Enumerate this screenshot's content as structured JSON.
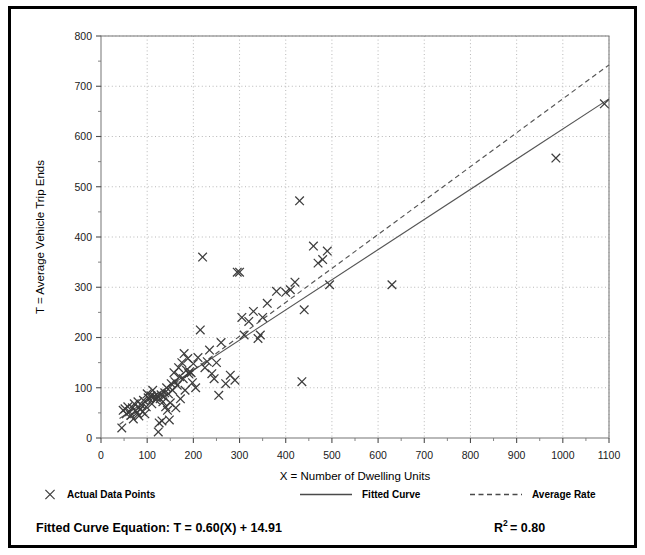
{
  "chart_data": {
    "type": "scatter",
    "title": "",
    "xlabel": "X = Number of Dwelling Units",
    "ylabel": "T = Average Vehicle Trip Ends",
    "xlim": [
      0,
      1100
    ],
    "ylim": [
      0,
      800
    ],
    "xticks": [
      0,
      100,
      200,
      300,
      400,
      500,
      600,
      700,
      800,
      900,
      1000,
      1100
    ],
    "yticks": [
      0,
      100,
      200,
      300,
      400,
      500,
      600,
      700,
      800
    ],
    "x_minor_step": 50,
    "y_minor_step": 50,
    "grid": "dotted-major-both",
    "legend_position": "below-axes",
    "series": [
      {
        "name": "Actual Data Points",
        "type": "scatter",
        "marker": "x",
        "color": "#3c3c3c",
        "points": [
          [
            45,
            20
          ],
          [
            48,
            55
          ],
          [
            52,
            58
          ],
          [
            55,
            48
          ],
          [
            58,
            62
          ],
          [
            62,
            52
          ],
          [
            65,
            45
          ],
          [
            68,
            60
          ],
          [
            70,
            38
          ],
          [
            72,
            68
          ],
          [
            75,
            55
          ],
          [
            78,
            50
          ],
          [
            80,
            72
          ],
          [
            82,
            44
          ],
          [
            85,
            58
          ],
          [
            88,
            65
          ],
          [
            90,
            52
          ],
          [
            92,
            75
          ],
          [
            95,
            48
          ],
          [
            98,
            62
          ],
          [
            100,
            88
          ],
          [
            102,
            80
          ],
          [
            105,
            78
          ],
          [
            108,
            84
          ],
          [
            110,
            68
          ],
          [
            112,
            95
          ],
          [
            115,
            82
          ],
          [
            118,
            76
          ],
          [
            120,
            80
          ],
          [
            122,
            84
          ],
          [
            124,
            12
          ],
          [
            126,
            30
          ],
          [
            128,
            78
          ],
          [
            130,
            86
          ],
          [
            132,
            34
          ],
          [
            134,
            72
          ],
          [
            136,
            82
          ],
          [
            138,
            90
          ],
          [
            140,
            62
          ],
          [
            142,
            100
          ],
          [
            144,
            55
          ],
          [
            146,
            88
          ],
          [
            148,
            36
          ],
          [
            150,
            70
          ],
          [
            152,
            108
          ],
          [
            155,
            95
          ],
          [
            158,
            130
          ],
          [
            160,
            112
          ],
          [
            162,
            60
          ],
          [
            165,
            105
          ],
          [
            168,
            140
          ],
          [
            170,
            122
          ],
          [
            172,
            78
          ],
          [
            175,
            150
          ],
          [
            178,
            118
          ],
          [
            180,
            168
          ],
          [
            182,
            95
          ],
          [
            185,
            135
          ],
          [
            188,
            158
          ],
          [
            190,
            128
          ],
          [
            192,
            132
          ],
          [
            195,
            130
          ],
          [
            198,
            110
          ],
          [
            200,
            148
          ],
          [
            205,
            100
          ],
          [
            210,
            160
          ],
          [
            215,
            215
          ],
          [
            220,
            360
          ],
          [
            225,
            140
          ],
          [
            230,
            152
          ],
          [
            235,
            175
          ],
          [
            240,
            128
          ],
          [
            245,
            118
          ],
          [
            250,
            150
          ],
          [
            255,
            85
          ],
          [
            260,
            190
          ],
          [
            270,
            108
          ],
          [
            280,
            125
          ],
          [
            290,
            115
          ],
          [
            295,
            330
          ],
          [
            300,
            330
          ],
          [
            305,
            240
          ],
          [
            310,
            205
          ],
          [
            320,
            232
          ],
          [
            330,
            252
          ],
          [
            340,
            198
          ],
          [
            345,
            205
          ],
          [
            350,
            240
          ],
          [
            360,
            268
          ],
          [
            380,
            292
          ],
          [
            400,
            290
          ],
          [
            410,
            295
          ],
          [
            420,
            310
          ],
          [
            430,
            472
          ],
          [
            435,
            112
          ],
          [
            440,
            255
          ],
          [
            460,
            382
          ],
          [
            470,
            348
          ],
          [
            480,
            355
          ],
          [
            490,
            372
          ],
          [
            495,
            305
          ],
          [
            630,
            305
          ],
          [
            985,
            557
          ],
          [
            1090,
            665
          ]
        ]
      }
    ],
    "lines": [
      {
        "name": "Fitted Curve",
        "style": "solid",
        "color": "#555555",
        "equation": "T = 0.60(X) + 14.91",
        "slope": 0.6,
        "intercept": 14.91,
        "x_from": 40,
        "x_to": 1100
      },
      {
        "name": "Average Rate",
        "style": "dashed",
        "color": "#555555",
        "slope": 0.675,
        "intercept": 0,
        "x_from": 40,
        "x_to": 1100
      }
    ]
  },
  "legend": {
    "items": [
      {
        "label": "Actual Data Points",
        "marker": "x"
      },
      {
        "label": "Fitted Curve",
        "marker": "solid-line"
      },
      {
        "label": "Average Rate",
        "marker": "dashed-line"
      }
    ]
  },
  "footer": {
    "equation_label": "Fitted Curve Equation:",
    "equation_value": "T = 0.60(X) + 14.91",
    "r_squared_base": "R",
    "r_squared_exp": "2",
    "r_squared_value": "= 0.80"
  },
  "colors": {
    "frame": "#000000",
    "axis": "#808080",
    "grid": "#b0b0b0",
    "marker": "#3c3c3c",
    "line": "#555555",
    "text": "#000000"
  }
}
